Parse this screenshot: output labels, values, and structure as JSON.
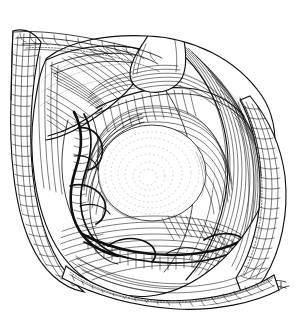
{
  "figure": {
    "kind": "anatomical-line-illustration",
    "technique": "pen-and-ink hatching",
    "title": "Surgical exposure — dissected wound with retracted skin-fat edges",
    "palette": {
      "background": "#ffffff",
      "ink": "#101010",
      "mid_ink": "#4a4a4a",
      "light_ink": "#8c8c8c",
      "ghost_ink": "#b6b6b6"
    },
    "canvas": {
      "width": 305,
      "height": 314
    },
    "bounds": {
      "left": 11,
      "top": 28,
      "right": 293,
      "bottom": 301
    }
  },
  "structures": [
    {
      "id": "wound-outline",
      "label": "Almond-shaped surgical opening",
      "note": "Leaf / almond shaped incision opened by retraction"
    },
    {
      "id": "skin-fat-edge-left",
      "label": "Retracted skin and subcutaneous fat edge (left)",
      "texture": "cobblestone fat lobules"
    },
    {
      "id": "skin-fat-edge-right",
      "label": "Retracted skin and subcutaneous fat edge (right)",
      "texture": "cobblestone fat lobules"
    },
    {
      "id": "skin-fat-edge-bottom",
      "label": "Retracted skin and subcutaneous fat edge (inferior)",
      "texture": "cobblestone fat lobules"
    },
    {
      "id": "fascia-flap-upper-left",
      "label": "Reflected fascial flap (upper left)",
      "texture": "dense parallel hatching"
    },
    {
      "id": "muscle-belly-right",
      "label": "Muscle belly with long parallel fibres (right)",
      "texture": "long sweeping fibre strokes"
    },
    {
      "id": "tendon-superior",
      "label": "Tendon entering wound from above",
      "texture": "smooth with transverse hatch"
    },
    {
      "id": "central-dome",
      "label": "Rounded exposed structure (bursa / sac) at centre",
      "texture": "concentric stipple rings, highlight"
    },
    {
      "id": "neurovascular-bundle-left",
      "label": "Neurovascular bundle coursing vertically (left)",
      "texture": "heavy dark twisted cord"
    },
    {
      "id": "vascular-arcade-inferior",
      "label": "Transverse vascular arcade at floor of wound",
      "texture": "heavy dark band with cross-hatch"
    },
    {
      "id": "deep-floor-hatch",
      "label": "Deep wound floor tissue",
      "texture": "cross-hatched shadow"
    }
  ]
}
